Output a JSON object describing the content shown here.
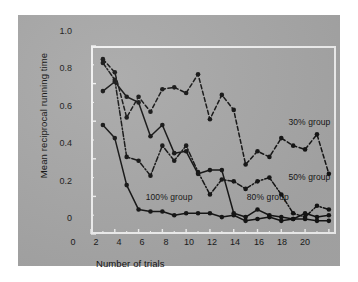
{
  "figure": {
    "background_color": "#ffffff",
    "plate_color": "#a8a8a8",
    "frame_color": "#f2f2f2",
    "ink_color": "#141414"
  },
  "chart_data": {
    "type": "line",
    "title": "",
    "xlabel": "Number of trials",
    "ylabel": "Mean reciprocal running time",
    "xlim": [
      0,
      20.6
    ],
    "ylim": [
      0,
      1.0
    ],
    "xticks": [
      0,
      2,
      4,
      6,
      8,
      10,
      12,
      14,
      16,
      18,
      20
    ],
    "xtick_labels": [
      "0",
      "2",
      "4",
      "6",
      "8",
      "10",
      "12",
      "14",
      "16",
      "18",
      "20"
    ],
    "xminorticks": [
      1,
      3,
      5,
      7,
      9,
      11,
      13,
      15,
      17,
      19
    ],
    "yticks": [
      0,
      0.2,
      0.4,
      0.6,
      0.8,
      1.0
    ],
    "ytick_labels": [
      "0",
      "0.2",
      "0.4",
      "0.6",
      "0.8",
      "1.0"
    ],
    "yminorticks": [
      0.1,
      0.3,
      0.5,
      0.7,
      0.9
    ],
    "grid": false,
    "legend_position": "inline-annotations",
    "x": [
      1,
      2,
      3,
      4,
      5,
      6,
      7,
      8,
      9,
      10,
      11,
      12,
      13,
      14,
      15,
      16,
      17,
      18,
      19,
      20
    ],
    "series": [
      {
        "name": "30% group",
        "label": "30% group",
        "linestyle": "dashed",
        "marker": "filled-circle",
        "color": "#141414",
        "values": [
          0.93,
          0.86,
          0.62,
          0.73,
          0.65,
          0.77,
          0.78,
          0.75,
          0.85,
          0.61,
          0.74,
          0.66,
          0.37,
          0.44,
          0.41,
          0.51,
          0.47,
          0.45,
          0.53,
          0.32
        ],
        "annotation": {
          "x": 16.6,
          "y": 0.595,
          "text": "30% group"
        }
      },
      {
        "name": "50% group",
        "label": "50% group",
        "linestyle": "dash-dot",
        "marker": "filled-circle",
        "color": "#141414",
        "values": [
          0.91,
          0.82,
          0.41,
          0.39,
          0.31,
          0.47,
          0.39,
          0.47,
          0.33,
          0.21,
          0.29,
          0.28,
          0.24,
          0.28,
          0.3,
          0.21,
          0.11,
          0.09,
          0.15,
          0.13
        ],
        "annotation": {
          "x": 16.6,
          "y": 0.305,
          "text": "50% group"
        }
      },
      {
        "name": "80% group",
        "label": "80% group",
        "linestyle": "solid",
        "marker": "filled-circle",
        "color": "#141414",
        "values": [
          0.76,
          0.81,
          0.73,
          0.7,
          0.52,
          0.58,
          0.43,
          0.44,
          0.32,
          0.34,
          0.34,
          0.11,
          0.09,
          0.13,
          0.1,
          0.09,
          0.08,
          0.11,
          0.09,
          0.1
        ],
        "annotation": {
          "x": 13.1,
          "y": 0.195,
          "text": "80% group"
        }
      },
      {
        "name": "100% group",
        "label": "100% group",
        "linestyle": "solid",
        "marker": "filled-circle",
        "color": "#141414",
        "values": [
          0.58,
          0.51,
          0.26,
          0.13,
          0.12,
          0.12,
          0.1,
          0.11,
          0.11,
          0.11,
          0.09,
          0.1,
          0.07,
          0.08,
          0.09,
          0.07,
          0.08,
          0.08,
          0.07,
          0.07
        ],
        "annotation": {
          "x": 4.6,
          "y": 0.195,
          "text": "100% group"
        }
      }
    ]
  }
}
